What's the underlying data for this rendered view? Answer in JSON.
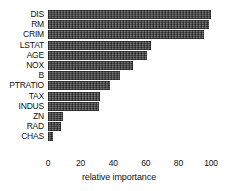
{
  "chart_data": {
    "type": "bar",
    "orientation": "horizontal",
    "title": "",
    "xlabel": "relative importance",
    "ylabel": "",
    "categories": [
      "DIS",
      "RM",
      "CRIM",
      "LSTAT",
      "AGE",
      "NOX",
      "B",
      "PTRATIO",
      "TAX",
      "INDUS",
      "ZN",
      "RAD",
      "CHAS"
    ],
    "values": [
      100,
      99,
      96,
      63,
      61,
      52,
      44,
      38,
      32,
      31,
      9,
      8,
      3
    ],
    "xlim": [
      0,
      100
    ],
    "xticks": [
      0,
      20,
      40,
      60,
      80,
      100
    ],
    "xtick_labels": [
      "0",
      "20",
      "40",
      "60",
      "80",
      "100"
    ],
    "grid": false,
    "legend": false,
    "bar_color": "#4d4d4d",
    "bar_pattern": "crosshatch",
    "background_color": "#ffffff"
  },
  "axis": {
    "x_title": "relative importance"
  },
  "top_strip": {
    "text": ""
  }
}
